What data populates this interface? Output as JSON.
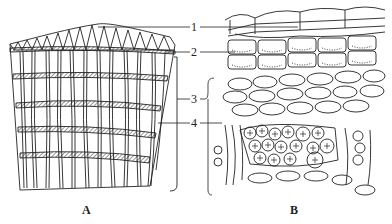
{
  "figure": {
    "panels": [
      {
        "id": "A",
        "caption": "A",
        "description": "Longitudinal block of periderm/bark with vertical cells and horizontal banded layers"
      },
      {
        "id": "B",
        "caption": "B",
        "description": "Cross-section of cells showing layers and cells with crystal druses"
      }
    ],
    "labels": [
      {
        "number": "1"
      },
      {
        "number": "2"
      },
      {
        "number": "3"
      },
      {
        "number": "4"
      }
    ]
  }
}
